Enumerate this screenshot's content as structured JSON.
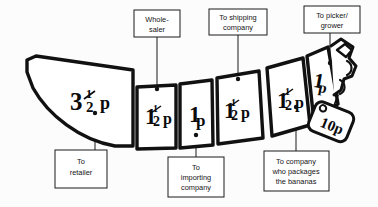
{
  "diagram": {
    "background_color": "#fcfcfc",
    "ink_color": "#111111",
    "fill_color": "#ffffff"
  },
  "price_tag": {
    "value": "10p",
    "name": "price-tag"
  },
  "segments": [
    {
      "id": "segment-retailer",
      "value": "3",
      "fraction_num": "1",
      "fraction_den": "2",
      "unit": "p",
      "display": "3½p"
    },
    {
      "id": "segment-wholesaler",
      "value": "1",
      "fraction_num": "1",
      "fraction_den": "2",
      "unit": "p",
      "display": "1½p"
    },
    {
      "id": "segment-importer",
      "value": "1",
      "fraction_num": "",
      "fraction_den": "",
      "unit": "p",
      "display": "1p"
    },
    {
      "id": "segment-shipping",
      "value": "1",
      "fraction_num": "1",
      "fraction_den": "2",
      "unit": "p",
      "display": "1½p"
    },
    {
      "id": "segment-packager",
      "value": "1",
      "fraction_num": "1",
      "fraction_den": "2",
      "unit": "p",
      "display": "1½p"
    },
    {
      "id": "segment-grower",
      "value": "1",
      "fraction_num": "",
      "fraction_den": "",
      "unit": "p",
      "display": "1p"
    }
  ],
  "labels": [
    {
      "id": "label-retailer",
      "lines": [
        "To",
        "retailer"
      ],
      "position": "below"
    },
    {
      "id": "label-wholesaler",
      "lines": [
        "Whole-",
        "saler"
      ],
      "position": "above"
    },
    {
      "id": "label-importing-company",
      "lines": [
        "To",
        "importing",
        "company"
      ],
      "position": "below"
    },
    {
      "id": "label-shipping-company",
      "lines": [
        "To shipping",
        "company"
      ],
      "position": "above"
    },
    {
      "id": "label-packaging-company",
      "lines": [
        "To company",
        "who packages",
        "the bananas"
      ],
      "position": "below"
    },
    {
      "id": "label-picker-grower",
      "lines": [
        "To picker/",
        "grower"
      ],
      "position": "above"
    }
  ]
}
